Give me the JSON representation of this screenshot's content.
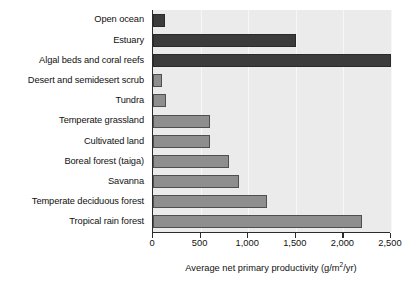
{
  "chart_data": {
    "type": "bar",
    "orientation": "horizontal",
    "title": "",
    "xlabel": "Average net primary productivity (g/m2/yr)",
    "xlabel_prefix": "Average net primary productivity (g/m",
    "xlabel_exponent": "2",
    "xlabel_suffix": "/yr)",
    "ylabel": "",
    "xlim": [
      0,
      2500
    ],
    "xticks": [
      0,
      500,
      1000,
      1500,
      2000,
      2500
    ],
    "xtick_labels": [
      "0",
      "500",
      "1,000",
      "1,500",
      "2,000",
      "2,500"
    ],
    "grid": true,
    "legend": "none",
    "categories": [
      "Open ocean",
      "Estuary",
      "Algal beds and coral reefs",
      "Desert and semidesert scrub",
      "Tundra",
      "Temperate grassland",
      "Cultivated land",
      "Boreal forest (taiga)",
      "Savanna",
      "Temperate deciduous forest",
      "Tropical rain forest"
    ],
    "values": [
      125,
      1500,
      2500,
      90,
      140,
      600,
      600,
      800,
      900,
      1200,
      2200
    ],
    "bar_styles": [
      "dark",
      "dark",
      "dark",
      "light",
      "light",
      "light",
      "light",
      "light",
      "light",
      "light",
      "light"
    ],
    "colors": {
      "dark_bar": "#3b3b3b",
      "light_bar": "#8e8e8e",
      "bar_border": "#4a4a4a",
      "plot_background": "#ebebeb",
      "axis_line": "#2b2b2b",
      "gridline": "#f7f7f7",
      "text": "#111111",
      "page_background": "#ffffff"
    }
  }
}
